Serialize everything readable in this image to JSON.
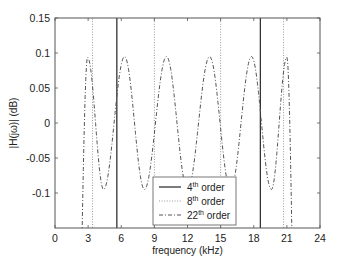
{
  "chart_data": {
    "type": "line",
    "title": "",
    "xlabel": "frequency (kHz)",
    "ylabel": "|H(jω)| (dB)",
    "xlim": [
      0,
      24
    ],
    "ylim": [
      -0.15,
      0.15
    ],
    "xticks": [
      0,
      3,
      6,
      9,
      12,
      15,
      18,
      21,
      24
    ],
    "yticks": [
      -0.1,
      -0.05,
      0,
      0.05,
      0.1,
      0.15
    ],
    "xtick_labels": [
      "0",
      "3",
      "6",
      "9",
      "12",
      "15",
      "18",
      "21",
      "24"
    ],
    "ytick_labels": [
      "-0.1",
      "-0.05",
      "0",
      "0.05",
      "0.1",
      "0.15"
    ],
    "grid": false,
    "legend_position": "lower center",
    "series": [
      {
        "name": "4th order",
        "sup": "th",
        "base": "4",
        "style": "solid",
        "color": "#333333",
        "description": "Passband ripple exceeds plot range; appears as near-vertical edges",
        "edges_khz": [
          5.6,
          18.6
        ]
      },
      {
        "name": "8th order",
        "sup": "th",
        "base": "8",
        "style": "dotted",
        "color": "#999999",
        "description": "Passband ripple exceeds plot range; appears as near-vertical edges",
        "edges_khz": [
          3.4,
          9.0,
          15.0,
          20.7
        ]
      },
      {
        "name": "22th order",
        "sup": "th",
        "base": "22",
        "style": "dashdot",
        "color": "#555555",
        "description": "Equiripple passband ±0.095 dB",
        "edges_khz": [
          2.4,
          21.5
        ],
        "peaks": [
          {
            "x": 2.95,
            "y": 0.094
          },
          {
            "x": 6.3,
            "y": 0.095
          },
          {
            "x": 10.1,
            "y": 0.095
          },
          {
            "x": 14.0,
            "y": 0.095
          },
          {
            "x": 17.8,
            "y": 0.095
          },
          {
            "x": 21.0,
            "y": 0.094
          }
        ],
        "troughs": [
          {
            "x": 4.4,
            "y": -0.095
          },
          {
            "x": 8.1,
            "y": -0.095
          },
          {
            "x": 12.0,
            "y": -0.095
          },
          {
            "x": 15.9,
            "y": -0.095
          },
          {
            "x": 19.6,
            "y": -0.095
          }
        ]
      }
    ]
  },
  "legend": {
    "items": [
      {
        "base": "4",
        "sup": "th",
        "rest": " order"
      },
      {
        "base": "8",
        "sup": "th",
        "rest": " order"
      },
      {
        "base": "22",
        "sup": "th",
        "rest": " order"
      }
    ]
  },
  "axes": {
    "xlabel": "frequency (kHz)",
    "ylabel": "|H(jω)| (dB)"
  }
}
